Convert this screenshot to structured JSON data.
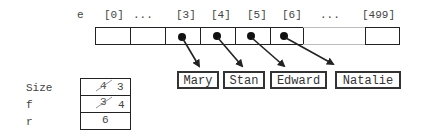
{
  "diagram": {
    "array": {
      "name": "e",
      "index_labels": [
        "[0]",
        "...",
        "[3]",
        "[4]",
        "[5]",
        "[6]",
        "...",
        "[499]"
      ],
      "cells": [
        {
          "index": "[0]",
          "pointer": false
        },
        {
          "index": "[1]",
          "pointer": false
        },
        {
          "index": "[3]",
          "pointer": true,
          "target": "Mary"
        },
        {
          "index": "[4]",
          "pointer": true,
          "target": "Stan"
        },
        {
          "index": "[5]",
          "pointer": true,
          "target": "Edward"
        },
        {
          "index": "[6]",
          "pointer": true,
          "target": "Natalie"
        },
        {
          "index": "[499]",
          "pointer": false
        }
      ]
    },
    "objects": [
      "Mary",
      "Stan",
      "Edward",
      "Natalie"
    ],
    "variables": [
      {
        "name": "Size",
        "old_value": "4",
        "value": "3"
      },
      {
        "name": "f",
        "old_value": "3",
        "value": "4"
      },
      {
        "name": "r",
        "old_value": "",
        "value": "6"
      }
    ],
    "colors": {
      "stroke": "#222222",
      "text": "#444444",
      "gap_line": "#bbbbbb"
    }
  }
}
